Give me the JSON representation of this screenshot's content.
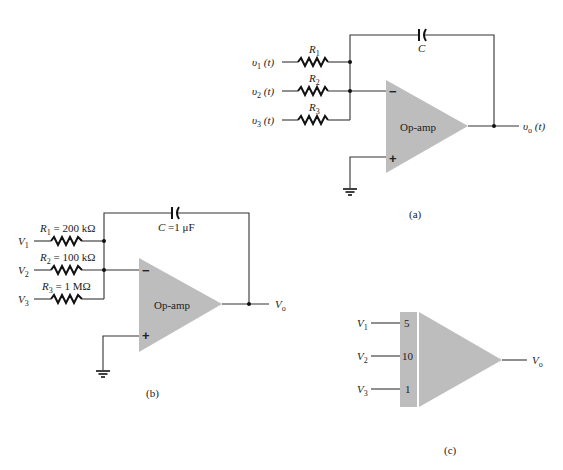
{
  "diagram_a": {
    "caption": "(a)",
    "inputs": [
      {
        "label": "υ",
        "sub": "1",
        "suffix": " (t)",
        "resistor": "R",
        "resistor_sub": "1"
      },
      {
        "label": "υ",
        "sub": "2",
        "suffix": " (t)",
        "resistor": "R",
        "resistor_sub": "2"
      },
      {
        "label": "υ",
        "sub": "3",
        "suffix": " (t)",
        "resistor": "R",
        "resistor_sub": "3"
      }
    ],
    "capacitor": "C",
    "opamp_label": "Op-amp",
    "inv_sign": "−",
    "noninv_sign": "+",
    "output": {
      "label": "υ",
      "sub": "o",
      "suffix": " (t)"
    }
  },
  "diagram_b": {
    "caption": "(b)",
    "inputs": [
      {
        "label": "V",
        "sub": "1",
        "resistor": "R",
        "resistor_sub": "1",
        "value": " = 200 kΩ"
      },
      {
        "label": "V",
        "sub": "2",
        "resistor": "R",
        "resistor_sub": "2",
        "value": " = 100 kΩ"
      },
      {
        "label": "V",
        "sub": "3",
        "resistor": "R",
        "resistor_sub": "3",
        "value": " = 1 MΩ"
      }
    ],
    "capacitor": "C",
    "capacitor_value": " =1 μF",
    "opamp_label": "Op-amp",
    "inv_sign": "−",
    "noninv_sign": "+",
    "output": {
      "label": "V",
      "sub": "o"
    }
  },
  "diagram_c": {
    "caption": "(c)",
    "inputs": [
      {
        "label": "V",
        "sub": "1",
        "gain": "5"
      },
      {
        "label": "V",
        "sub": "2",
        "gain": "10"
      },
      {
        "label": "V",
        "sub": "3",
        "gain": "1"
      }
    ],
    "output": {
      "label": "V",
      "sub": "o"
    }
  }
}
